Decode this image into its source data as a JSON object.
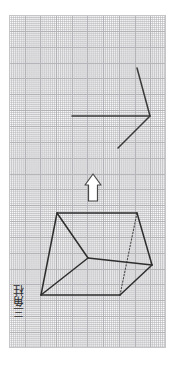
{
  "worksheet": {
    "title": "Triangular prism net worksheet",
    "background_color": "#ffffff",
    "paper": {
      "name": "graph-paper",
      "grid_color": "#b9b9bd",
      "minor_grid_color": "#aaaaaf",
      "major_cell_px": 15.7,
      "x": 9,
      "y": 15,
      "width": 157,
      "height": 333
    }
  },
  "label": {
    "prism_text": "三角柱",
    "color": "#2b2b2b",
    "orientation": "vertical-rotated-90"
  },
  "figures": {
    "fold_line": {
      "name": "folded-edge-diagram",
      "stroke_color": "#3a3a3a",
      "stroke_width": 1.4,
      "points": [
        {
          "x": 137,
          "y": 68
        },
        {
          "x": 150,
          "y": 116
        },
        {
          "x": 118,
          "y": 148
        }
      ],
      "horizontal_segment": [
        {
          "x": 72,
          "y": 116
        },
        {
          "x": 150,
          "y": 116
        }
      ]
    },
    "up_arrow": {
      "name": "up-arrow-glyph",
      "stroke_color": "#4a4a4a",
      "fill_color": "#ffffff",
      "x": 85,
      "y": 174,
      "width": 16,
      "height": 27,
      "direction": "up"
    },
    "prism": {
      "name": "triangular-prism",
      "stroke_color": "#2e2e2e",
      "hidden_edge_style": "dotted",
      "stroke_width": 1.4,
      "vertices": {
        "top_back_left": {
          "x": 57,
          "y": 213
        },
        "top_back_right": {
          "x": 137,
          "y": 213
        },
        "front_bottom_left": {
          "x": 41,
          "y": 295
        },
        "front_bottom_right": {
          "x": 120,
          "y": 295
        },
        "mid_left": {
          "x": 88,
          "y": 258
        },
        "mid_right": {
          "x": 152,
          "y": 265
        }
      },
      "edges": [
        "top_back_left-top_back_right",
        "top_back_left-front_bottom_left",
        "top_back_left-mid_left",
        "front_bottom_left-mid_left",
        "mid_left-mid_right",
        "top_back_right-mid_right",
        "mid_right-front_bottom_right",
        "front_bottom_left-front_bottom_right"
      ],
      "hidden_edges": [
        "top_back_right-front_bottom_right"
      ]
    }
  }
}
